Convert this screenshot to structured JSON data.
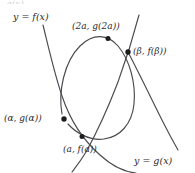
{
  "figure": {
    "background_color": "#ffffff",
    "curve_color": "#4a4a4f",
    "point_color": "#1c1c1c",
    "text_color": "#2a2a2e",
    "width": 195,
    "height": 173,
    "top_cropped_artifact": "g(x)"
  },
  "curve_labels": {
    "f_curve": "y = f(x)",
    "g_curve": "y = g(x)"
  },
  "points": [
    {
      "id": "point-2a",
      "label": "(2a, g(2a))",
      "x": 108,
      "y": 39,
      "description": "maximum of the arc"
    },
    {
      "id": "point-beta",
      "label": "(β, f(β))",
      "x": 128,
      "y": 52,
      "description": "right intersection of f and g"
    },
    {
      "id": "point-alpha",
      "label": "(α, g(α))",
      "x": 64,
      "y": 119,
      "description": "left intersection of f and g"
    },
    {
      "id": "point-a",
      "label": "(a, f(a))",
      "x": 82,
      "y": 136,
      "description": "minimum of the arc"
    }
  ],
  "paths": {
    "f_curve": "M 43,26 C 50,52 58,86 66,110 C 74,132 86,148 100,160",
    "f_curve_right_branch": "M 100,160 L 101,161",
    "g_curve": "M 137,17 C 133,40 120,78 108,105 C 99,127 90,145 83,159",
    "arc_curve": "M 55,103 C 60,66 80,40 105,38 C 130,36 143,68 140,100 C 137,128 118,142 96,139 C 82,137 71,130 64,122"
  }
}
